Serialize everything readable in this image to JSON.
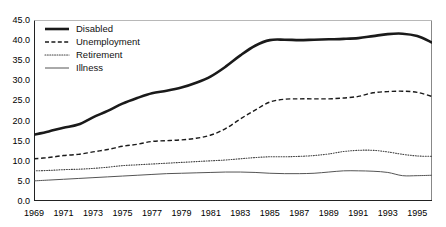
{
  "chart_data": {
    "type": "line",
    "title": "",
    "xlabel": "",
    "ylabel": "",
    "xlim": [
      1969,
      1996
    ],
    "ylim": [
      0.0,
      45.0
    ],
    "grid": false,
    "legend_position": "top-left",
    "x": [
      1969,
      1970,
      1971,
      1972,
      1973,
      1974,
      1975,
      1976,
      1977,
      1978,
      1979,
      1980,
      1981,
      1982,
      1983,
      1984,
      1985,
      1986,
      1987,
      1988,
      1989,
      1990,
      1991,
      1992,
      1993,
      1994,
      1995,
      1996
    ],
    "xtick_labels": [
      "1969",
      "1971",
      "1973",
      "1975",
      "1977",
      "1979",
      "1981",
      "1983",
      "1985",
      "1987",
      "1989",
      "1991",
      "1993",
      "1995"
    ],
    "ytick_labels": [
      "0.0",
      "5.0",
      "10.0",
      "15.0",
      "20.0",
      "25.0",
      "30.0",
      "35.0",
      "40.0",
      "45.0"
    ],
    "ytick_values": [
      0.0,
      5.0,
      10.0,
      15.0,
      20.0,
      25.0,
      30.0,
      35.0,
      40.0,
      45.0
    ],
    "series": [
      {
        "name": "Disabled",
        "style": "solid-thick",
        "color": "#1a1a1a",
        "values": [
          16.5,
          17.3,
          18.2,
          19.0,
          20.8,
          22.4,
          24.2,
          25.6,
          26.8,
          27.4,
          28.2,
          29.4,
          31.0,
          33.4,
          36.2,
          38.6,
          40.0,
          40.1,
          40.0,
          40.1,
          40.2,
          40.3,
          40.5,
          41.0,
          41.5,
          41.6,
          41.0,
          39.4
        ]
      },
      {
        "name": "Unemployment",
        "style": "dashed",
        "color": "#1a1a1a",
        "values": [
          10.5,
          10.8,
          11.3,
          11.6,
          12.2,
          12.8,
          13.6,
          14.1,
          14.8,
          15.0,
          15.2,
          15.6,
          16.4,
          18.0,
          20.4,
          22.6,
          24.6,
          25.3,
          25.4,
          25.4,
          25.4,
          25.6,
          26.0,
          26.9,
          27.2,
          27.3,
          27.0,
          26.0
        ]
      },
      {
        "name": "Retirement",
        "style": "dotted",
        "color": "#444444",
        "values": [
          7.5,
          7.6,
          7.8,
          7.9,
          8.1,
          8.4,
          8.8,
          9.0,
          9.2,
          9.4,
          9.6,
          9.8,
          10.0,
          10.2,
          10.5,
          10.8,
          11.0,
          11.0,
          11.1,
          11.3,
          11.7,
          12.3,
          12.6,
          12.6,
          12.2,
          11.6,
          11.2,
          11.1
        ]
      },
      {
        "name": "Illness",
        "style": "solid-thin",
        "color": "#555555",
        "values": [
          5.0,
          5.2,
          5.4,
          5.6,
          5.8,
          6.0,
          6.2,
          6.4,
          6.6,
          6.8,
          6.9,
          7.0,
          7.1,
          7.2,
          7.2,
          7.1,
          6.9,
          6.8,
          6.8,
          6.9,
          7.2,
          7.5,
          7.5,
          7.4,
          7.1,
          6.3,
          6.3,
          6.4
        ]
      }
    ]
  },
  "legend": {
    "items": [
      {
        "label": "Disabled"
      },
      {
        "label": "Unemployment"
      },
      {
        "label": "Retirement"
      },
      {
        "label": "Illness"
      }
    ]
  }
}
